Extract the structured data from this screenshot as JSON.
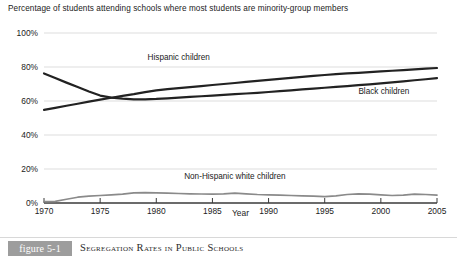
{
  "chart_data": {
    "type": "line",
    "title": "Percentage of students attending schools where most students are minority-group members",
    "xlabel": "Year",
    "ylabel": "",
    "xlim": [
      1970,
      2005
    ],
    "ylim": [
      0,
      100
    ],
    "grid": true,
    "legend_position": "inline-labels",
    "x_ticks": [
      "1970",
      "1975",
      "1980",
      "1985",
      "1990",
      "1995",
      "2000",
      "2005"
    ],
    "y_ticks": [
      "0%",
      "20%",
      "40%",
      "60%",
      "80%",
      "100%"
    ],
    "x": [
      1970,
      1971,
      1972,
      1973,
      1974,
      1975,
      1976,
      1977,
      1978,
      1979,
      1980,
      1981,
      1982,
      1983,
      1984,
      1985,
      1986,
      1987,
      1988,
      1989,
      1990,
      1991,
      1992,
      1993,
      1994,
      1995,
      1996,
      1997,
      1998,
      1999,
      2000,
      2001,
      2002,
      2003,
      2004,
      2005
    ],
    "series": [
      {
        "name": "Hispanic children",
        "color": "#222222",
        "label_x": 1982,
        "label_y": 84,
        "values": [
          54.8,
          56.0,
          57.2,
          58.4,
          59.6,
          60.8,
          61.9,
          63.0,
          64.0,
          65.2,
          66.2,
          67.0,
          67.6,
          68.2,
          68.8,
          69.4,
          70.0,
          70.6,
          71.2,
          71.8,
          72.4,
          73.0,
          73.6,
          74.2,
          74.8,
          75.3,
          75.8,
          76.2,
          76.6,
          77.0,
          77.4,
          77.8,
          78.2,
          78.6,
          79.0,
          79.4
        ]
      },
      {
        "name": "Black children",
        "color": "#222222",
        "label_x": 1998,
        "label_y": 64,
        "values": [
          76.2,
          73.5,
          70.8,
          68.2,
          65.6,
          63.2,
          62.0,
          61.4,
          61.0,
          61.0,
          61.2,
          61.6,
          62.0,
          62.4,
          62.8,
          63.2,
          63.6,
          64.0,
          64.4,
          64.8,
          65.3,
          65.8,
          66.3,
          66.8,
          67.3,
          67.8,
          68.3,
          68.8,
          69.3,
          69.8,
          70.4,
          71.0,
          71.6,
          72.2,
          72.8,
          73.4
        ]
      },
      {
        "name": "Non-Hispanic white children",
        "color": "#8a8a8a",
        "label_x": 1987,
        "label_y": 14,
        "values": [
          0.8,
          1.0,
          2.2,
          3.4,
          4.0,
          4.4,
          4.8,
          5.2,
          6.0,
          6.1,
          6.0,
          5.8,
          5.6,
          5.4,
          5.3,
          5.2,
          5.4,
          5.8,
          5.4,
          5.0,
          4.8,
          4.6,
          4.4,
          4.2,
          4.0,
          3.8,
          4.2,
          5.0,
          5.4,
          5.2,
          4.8,
          4.4,
          4.6,
          5.2,
          5.0,
          4.6
        ]
      }
    ]
  },
  "caption": {
    "badge": "figure 5-1",
    "text": "Segregation Rates in Public Schools"
  },
  "colors": {
    "gridline": "#d9d9d9",
    "axis": "#3a3a3a",
    "dark_series": "#222222",
    "gray_series": "#8a8a8a",
    "badge_bg": "#9d9d9d"
  }
}
